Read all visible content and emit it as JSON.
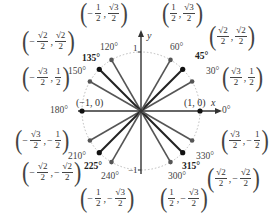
{
  "diagram": {
    "center": [
      141,
      111
    ],
    "radius": 59,
    "axes": {
      "x_label": "x",
      "y_label": "y",
      "y_top_tick": "1",
      "y_bottom_tick": "−1"
    },
    "axis_points": [
      {
        "angle": "0°",
        "coord": "(1, 0)"
      },
      {
        "angle": "180°",
        "coord": "(−1, 0)"
      }
    ],
    "angles": [
      {
        "deg": 30,
        "label": "30°",
        "bold": false,
        "x": [
          "√3",
          "2"
        ],
        "y": [
          "1",
          "2"
        ],
        "xneg": false,
        "yneg": false
      },
      {
        "deg": 45,
        "label": "45°",
        "bold": true,
        "x": [
          "√2",
          "2"
        ],
        "y": [
          "√2",
          "2"
        ],
        "xneg": false,
        "yneg": false
      },
      {
        "deg": 60,
        "label": "60°",
        "bold": false,
        "x": [
          "1",
          "2"
        ],
        "y": [
          "√3",
          "2"
        ],
        "xneg": false,
        "yneg": false
      },
      {
        "deg": 120,
        "label": "120°",
        "bold": false,
        "x": [
          "1",
          "2"
        ],
        "y": [
          "√3",
          "2"
        ],
        "xneg": true,
        "yneg": false
      },
      {
        "deg": 135,
        "label": "135°",
        "bold": true,
        "x": [
          "√2",
          "2"
        ],
        "y": [
          "√2",
          "2"
        ],
        "xneg": true,
        "yneg": false
      },
      {
        "deg": 150,
        "label": "150°",
        "bold": false,
        "x": [
          "√3",
          "2"
        ],
        "y": [
          "1",
          "2"
        ],
        "xneg": true,
        "yneg": false
      },
      {
        "deg": 210,
        "label": "210°",
        "bold": false,
        "x": [
          "√3",
          "2"
        ],
        "y": [
          "1",
          "2"
        ],
        "xneg": true,
        "yneg": true
      },
      {
        "deg": 225,
        "label": "225°",
        "bold": true,
        "x": [
          "√2",
          "2"
        ],
        "y": [
          "√2",
          "2"
        ],
        "xneg": true,
        "yneg": true
      },
      {
        "deg": 240,
        "label": "240°",
        "bold": false,
        "x": [
          "1",
          "2"
        ],
        "y": [
          "√3",
          "2"
        ],
        "xneg": true,
        "yneg": true
      },
      {
        "deg": 300,
        "label": "300°",
        "bold": false,
        "x": [
          "1",
          "2"
        ],
        "y": [
          "√3",
          "2"
        ],
        "xneg": false,
        "yneg": true
      },
      {
        "deg": 315,
        "label": "315°",
        "bold": true,
        "x": [
          "√2",
          "2"
        ],
        "y": [
          "√2",
          "2"
        ],
        "xneg": false,
        "yneg": true
      },
      {
        "deg": 330,
        "label": "330°",
        "bold": false,
        "x": [
          "√3",
          "2"
        ],
        "y": [
          "1",
          "2"
        ],
        "xneg": false,
        "yneg": true
      }
    ],
    "colors": {
      "spoke": "#555555",
      "spoke_bold": "#222222",
      "circle": "#bbbbbb",
      "axis": "#333333"
    }
  }
}
